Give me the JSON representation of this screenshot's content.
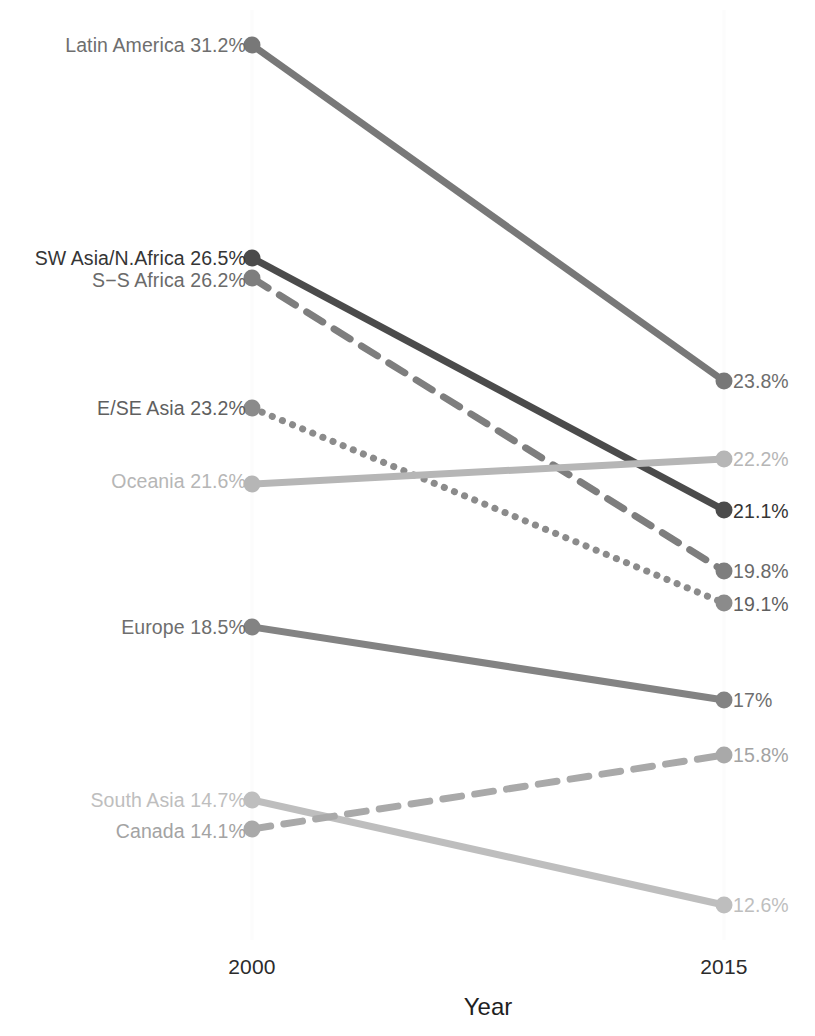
{
  "chart_data": {
    "type": "line",
    "chart_variant": "slope-chart",
    "title": "",
    "subtitle": "",
    "xlabel": "Year",
    "ylabel": "",
    "categories": [
      "2000",
      "2015"
    ],
    "x": [
      2000,
      2015
    ],
    "xtick_labels": [
      "2000",
      "2015"
    ],
    "grid": false,
    "gridlines_vertical_faint": true,
    "legend_position": "none",
    "value_suffix": "%",
    "ylim": [
      11.5,
      32.5
    ],
    "series": [
      {
        "name": "Latin America",
        "values": [
          31.2,
          23.8
        ],
        "left_label": "Latin America 31.2%",
        "right_label": "23.8%",
        "line_style": "solid",
        "color": "#787878",
        "label_color": "#6e6e6e",
        "y_px": [
          45,
          381
        ]
      },
      {
        "name": "SW Asia/N.Africa",
        "values": [
          26.5,
          21.1
        ],
        "left_label": "SW Asia/N.Africa 26.5%",
        "right_label": "21.1%",
        "line_style": "solid",
        "color": "#4b4b4b",
        "label_color": "#353535",
        "y_px": [
          258,
          510
        ]
      },
      {
        "name": "S−S Africa",
        "values": [
          26.2,
          19.8
        ],
        "left_label": "S−S Africa 26.2%",
        "right_label": "19.8%",
        "line_style": "dashed",
        "color": "#7e7e7e",
        "label_color": "#6a6a6a",
        "y_px": [
          278,
          571
        ]
      },
      {
        "name": "E/SE Asia",
        "values": [
          23.2,
          19.1
        ],
        "left_label": "E/SE Asia 23.2%",
        "right_label": "19.1%",
        "line_style": "dotted",
        "color": "#8b8b8b",
        "label_color": "#5f5f5f",
        "y_px": [
          408,
          603
        ]
      },
      {
        "name": "Oceania",
        "values": [
          21.6,
          22.2
        ],
        "left_label": "Oceania 21.6%",
        "right_label": "22.2%",
        "line_style": "solid",
        "color": "#b6b6b6",
        "label_color": "#b6b6b6",
        "y_px": [
          484,
          459
        ]
      },
      {
        "name": "Europe",
        "values": [
          18.5,
          17.0
        ],
        "left_label": "Europe 18.5%",
        "right_label": "17%",
        "line_style": "solid",
        "color": "#838383",
        "label_color": "#6e6e6e",
        "y_px": [
          627,
          700
        ]
      },
      {
        "name": "South Asia",
        "values": [
          14.7,
          12.6
        ],
        "left_label": "South Asia 14.7%",
        "right_label": "12.6%",
        "line_style": "solid",
        "color": "#bebebe",
        "label_color": "#bebebe",
        "y_px": [
          800,
          905
        ]
      },
      {
        "name": "Canada",
        "values": [
          14.1,
          15.8
        ],
        "left_label": "Canada 14.1%",
        "right_label": "15.8%",
        "line_style": "dashed",
        "color": "#a9a9a9",
        "label_color": "#a3a3a3",
        "y_px": [
          829,
          755
        ]
      }
    ]
  },
  "axis": {
    "tick_2000": "2000",
    "tick_2015": "2015",
    "title": "Year"
  },
  "labels": {
    "latin_america_left": "Latin America 31.2%",
    "latin_america_right": "23.8%",
    "sw_asia_left": "SW Asia/N.Africa 26.5%",
    "sw_asia_right": "21.1%",
    "ss_africa_left": "S−S Africa 26.2%",
    "ss_africa_right": "19.8%",
    "ese_asia_left": "E/SE Asia 23.2%",
    "ese_asia_right": "19.1%",
    "oceania_left": "Oceania 21.6%",
    "oceania_right": "22.2%",
    "europe_left": "Europe 18.5%",
    "europe_right": "17%",
    "south_asia_left": "South Asia 14.7%",
    "south_asia_right": "12.6%",
    "canada_left": "Canada 14.1%",
    "canada_right": "15.8%"
  },
  "geometry": {
    "x_left_px": 252,
    "x_right_px": 724,
    "marker_radius_px": 8.5,
    "line_width_px": 7
  }
}
